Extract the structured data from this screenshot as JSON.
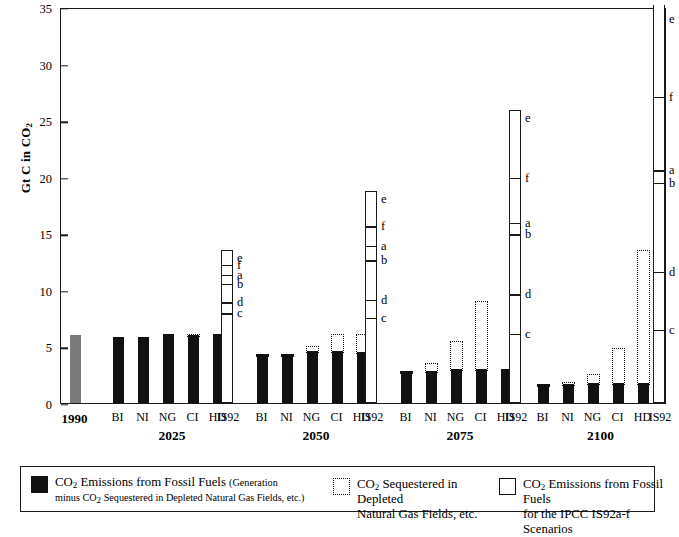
{
  "chart_data": {
    "type": "bar",
    "title": "",
    "xlabel": "",
    "ylabel": "Gt C in CO2",
    "ylim": [
      0,
      35
    ],
    "yticks": [
      0,
      5,
      10,
      15,
      20,
      25,
      30,
      35
    ],
    "grid": false,
    "legend_position": "bottom",
    "scenario_labels": [
      "BI",
      "NI",
      "NG",
      "CI",
      "CI",
      "HD",
      "IS92"
    ],
    "groups": [
      {
        "year": "1990",
        "reference": true,
        "bars": [
          {
            "label": "1990",
            "emissions": 6.0,
            "sequestered": 0,
            "style": "gray"
          }
        ]
      },
      {
        "year": "2025",
        "bars": [
          {
            "label": "BI",
            "emissions": 5.8,
            "sequestered": 0
          },
          {
            "label": "NI",
            "emissions": 5.8,
            "sequestered": 0
          },
          {
            "label": "NG",
            "emissions": 6.1,
            "sequestered": 0
          },
          {
            "label": "CI",
            "emissions": 6.0,
            "sequestered": 0.3
          },
          {
            "label": "HD",
            "emissions": 6.1,
            "sequestered": 0
          }
        ],
        "is92": {
          "top": 13.5,
          "overflow": false,
          "segments": [
            {
              "scenario": "e",
              "value": 13.5
            },
            {
              "scenario": "f",
              "value": 12.3
            },
            {
              "scenario": "a",
              "value": 11.4
            },
            {
              "scenario": "b",
              "value": 10.6
            },
            {
              "scenario": "d",
              "value": 9.0
            },
            {
              "scenario": "c",
              "value": 8.0
            }
          ]
        }
      },
      {
        "year": "2050",
        "bars": [
          {
            "label": "BI",
            "emissions": 4.3,
            "sequestered": 0.2
          },
          {
            "label": "NI",
            "emissions": 4.3,
            "sequestered": 0.2
          },
          {
            "label": "NG",
            "emissions": 4.6,
            "sequestered": 0.6
          },
          {
            "label": "CI",
            "emissions": 4.6,
            "sequestered": 1.7
          },
          {
            "label": "HD",
            "emissions": 4.5,
            "sequestered": 1.8
          }
        ],
        "is92": {
          "top": 18.7,
          "overflow": false,
          "segments": [
            {
              "scenario": "e",
              "value": 18.7
            },
            {
              "scenario": "f",
              "value": 15.7
            },
            {
              "scenario": "a",
              "value": 14.0
            },
            {
              "scenario": "b",
              "value": 12.7
            },
            {
              "scenario": "d",
              "value": 9.2
            },
            {
              "scenario": "c",
              "value": 7.6
            }
          ]
        }
      },
      {
        "year": "2075",
        "bars": [
          {
            "label": "BI",
            "emissions": 2.8,
            "sequestered": 0.2
          },
          {
            "label": "NI",
            "emissions": 2.8,
            "sequestered": 0.9
          },
          {
            "label": "NG",
            "emissions": 3.0,
            "sequestered": 2.7
          },
          {
            "label": "CI",
            "emissions": 3.0,
            "sequestered": 6.2
          },
          {
            "label": "HD",
            "emissions": 3.0,
            "sequestered": 0
          }
        ],
        "is92": {
          "top": 25.9,
          "overflow": false,
          "segments": [
            {
              "scenario": "e",
              "value": 25.9
            },
            {
              "scenario": "f",
              "value": 20.0
            },
            {
              "scenario": "a",
              "value": 16.0
            },
            {
              "scenario": "b",
              "value": 15.0
            },
            {
              "scenario": "d",
              "value": 9.7
            },
            {
              "scenario": "c",
              "value": 6.2
            }
          ]
        }
      },
      {
        "year": "2100",
        "bars": [
          {
            "label": "BI",
            "emissions": 1.7,
            "sequestered": 0.2
          },
          {
            "label": "NI",
            "emissions": 1.7,
            "sequestered": 0.3
          },
          {
            "label": "NG",
            "emissions": 1.8,
            "sequestered": 0.9
          },
          {
            "label": "CI",
            "emissions": 1.8,
            "sequestered": 3.2
          },
          {
            "label": "HD",
            "emissions": 1.8,
            "sequestered": 11.9
          }
        ],
        "is92": {
          "top": 35.0,
          "overflow": true,
          "segments": [
            {
              "scenario": "e",
              "value": 34.4
            },
            {
              "scenario": "f",
              "value": 26.9
            },
            {
              "scenario": "a",
              "value": 20.4
            },
            {
              "scenario": "b",
              "value": 19.3
            },
            {
              "scenario": "d",
              "value": 11.4
            },
            {
              "scenario": "c",
              "value": 6.3
            }
          ]
        }
      }
    ]
  },
  "legend": {
    "items": [
      {
        "swatch": "filled",
        "line1": "CO2 Emissions from Fossil Fuels",
        "line1_small": "(Generation",
        "line2_small": "minus CO2 Sequestered in Depleted Natural Gas Fields, etc.)"
      },
      {
        "swatch": "dotted",
        "line1": "CO2 Sequestered in Depleted",
        "line2": "Natural Gas Fields, etc."
      },
      {
        "swatch": "open",
        "line1": "CO2 Emissions from Fossil Fuels",
        "line2": "for the IPCC IS92a-f Scenarios"
      }
    ]
  }
}
